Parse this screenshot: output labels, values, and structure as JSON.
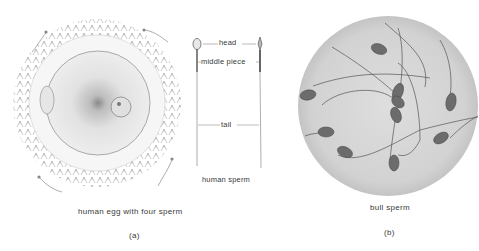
{
  "panel_a": {
    "egg_caption": "human egg with four sperm",
    "sperm_caption": "human sperm",
    "labels": {
      "head": "head",
      "middle_piece": "middle piece",
      "tail": "tail"
    },
    "panel_label": "(a)"
  },
  "panel_b": {
    "caption": "bull sperm",
    "panel_label": "(b)"
  }
}
